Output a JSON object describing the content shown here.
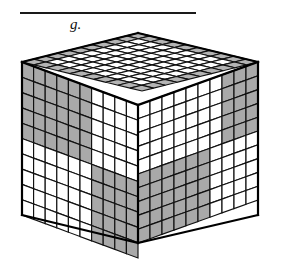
{
  "figure": {
    "label": "g.",
    "caption_rule": true,
    "type": "isometric-cube-diagram"
  },
  "colors": {
    "shaded": "#a9a9a9",
    "unshaded": "#ffffff",
    "top_shaded": "#b4b4b4",
    "top_unshaded": "#ffffff",
    "edge": "#111111",
    "outline": "#000000",
    "background": "#ffffff",
    "rule": "#1a1a1a"
  },
  "cube": {
    "divisions": 10,
    "faces": [
      "top",
      "left",
      "right"
    ],
    "geometry": {
      "top_vertex": [
        138,
        33
      ],
      "left_vertex": [
        22,
        62
      ],
      "right_vertex": [
        258,
        62
      ],
      "front_vertex": [
        138,
        105
      ],
      "left_bottom": [
        22,
        215
      ],
      "right_bottom": [
        258,
        215
      ],
      "front_bottom": [
        138,
        243
      ]
    },
    "top_face": {
      "rows": 10,
      "cols": 10,
      "shaded_cells": [
        [
          0,
          0
        ],
        [
          0,
          1
        ],
        [
          0,
          2
        ],
        [
          0,
          3
        ],
        [
          0,
          4
        ],
        [
          0,
          5
        ],
        [
          0,
          6
        ],
        [
          0,
          7
        ],
        [
          0,
          8
        ],
        [
          0,
          9
        ],
        [
          1,
          0
        ],
        [
          1,
          9
        ],
        [
          2,
          0
        ],
        [
          2,
          9
        ],
        [
          3,
          0
        ],
        [
          3,
          9
        ],
        [
          4,
          0
        ],
        [
          4,
          9
        ],
        [
          5,
          0
        ],
        [
          5,
          9
        ],
        [
          6,
          0
        ],
        [
          6,
          9
        ],
        [
          7,
          0
        ],
        [
          7,
          9
        ],
        [
          8,
          0
        ],
        [
          8,
          9
        ],
        [
          9,
          0
        ],
        [
          9,
          1
        ],
        [
          9,
          2
        ],
        [
          9,
          3
        ],
        [
          9,
          4
        ],
        [
          9,
          5
        ],
        [
          9,
          6
        ],
        [
          9,
          7
        ],
        [
          9,
          8
        ],
        [
          9,
          9
        ]
      ]
    },
    "left_face": {
      "rows": 10,
      "cols": 10,
      "shaded_cells": [
        [
          0,
          0
        ],
        [
          0,
          1
        ],
        [
          0,
          2
        ],
        [
          0,
          3
        ],
        [
          0,
          4
        ],
        [
          0,
          5
        ],
        [
          1,
          0
        ],
        [
          1,
          1
        ],
        [
          1,
          2
        ],
        [
          1,
          3
        ],
        [
          1,
          4
        ],
        [
          1,
          5
        ],
        [
          2,
          0
        ],
        [
          2,
          1
        ],
        [
          2,
          2
        ],
        [
          2,
          3
        ],
        [
          2,
          4
        ],
        [
          2,
          5
        ],
        [
          3,
          0
        ],
        [
          3,
          1
        ],
        [
          3,
          2
        ],
        [
          3,
          3
        ],
        [
          3,
          4
        ],
        [
          3,
          5
        ],
        [
          4,
          0
        ],
        [
          4,
          1
        ],
        [
          4,
          2
        ],
        [
          4,
          3
        ],
        [
          4,
          4
        ],
        [
          4,
          5
        ],
        [
          5,
          6
        ],
        [
          5,
          7
        ],
        [
          5,
          8
        ],
        [
          5,
          9
        ],
        [
          6,
          6
        ],
        [
          6,
          7
        ],
        [
          6,
          8
        ],
        [
          6,
          9
        ],
        [
          7,
          6
        ],
        [
          7,
          7
        ],
        [
          7,
          8
        ],
        [
          7,
          9
        ],
        [
          8,
          6
        ],
        [
          8,
          7
        ],
        [
          8,
          8
        ],
        [
          8,
          9
        ],
        [
          9,
          6
        ],
        [
          9,
          7
        ],
        [
          9,
          8
        ],
        [
          9,
          9
        ]
      ]
    },
    "right_face": {
      "rows": 10,
      "cols": 10,
      "shaded_cells": [
        [
          0,
          7
        ],
        [
          0,
          8
        ],
        [
          0,
          9
        ],
        [
          1,
          7
        ],
        [
          1,
          8
        ],
        [
          1,
          9
        ],
        [
          2,
          7
        ],
        [
          2,
          8
        ],
        [
          2,
          9
        ],
        [
          3,
          7
        ],
        [
          3,
          8
        ],
        [
          3,
          9
        ],
        [
          4,
          7
        ],
        [
          4,
          8
        ],
        [
          4,
          9
        ],
        [
          5,
          0
        ],
        [
          5,
          1
        ],
        [
          5,
          2
        ],
        [
          5,
          3
        ],
        [
          5,
          4
        ],
        [
          5,
          5
        ],
        [
          6,
          0
        ],
        [
          6,
          1
        ],
        [
          6,
          2
        ],
        [
          6,
          3
        ],
        [
          6,
          4
        ],
        [
          6,
          5
        ],
        [
          7,
          0
        ],
        [
          7,
          1
        ],
        [
          7,
          2
        ],
        [
          7,
          3
        ],
        [
          7,
          4
        ],
        [
          7,
          5
        ],
        [
          8,
          0
        ],
        [
          8,
          1
        ],
        [
          8,
          2
        ],
        [
          8,
          3
        ],
        [
          8,
          4
        ],
        [
          8,
          5
        ],
        [
          9,
          0
        ],
        [
          9,
          1
        ],
        [
          9,
          2
        ],
        [
          9,
          3
        ],
        [
          9,
          4
        ],
        [
          9,
          5
        ]
      ]
    }
  }
}
